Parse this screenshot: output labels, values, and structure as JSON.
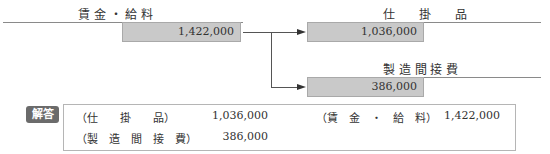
{
  "diagram": {
    "source_account": {
      "title": "賃 金 ・ 給 料",
      "amount": "1,422,000"
    },
    "targets": [
      {
        "title": "仕　　掛　　品",
        "amount": "1,036,000"
      },
      {
        "title": "製 造 間 接 費",
        "amount": "386,000"
      }
    ]
  },
  "answer": {
    "badge": "解答",
    "rows": [
      {
        "debit_account": "（仕　　掛　　品）",
        "debit_amount": "1,036,000",
        "credit_account": "（賃　金　・　給　料）",
        "credit_amount": "1,422,000"
      },
      {
        "debit_account": "（製　造　間　接　費）",
        "debit_amount": "386,000",
        "credit_account": "",
        "credit_amount": ""
      }
    ]
  },
  "colors": {
    "box_fill": "#c9c9c9",
    "badge_fill": "#6b6b6b",
    "line": "#8a8a8a"
  }
}
